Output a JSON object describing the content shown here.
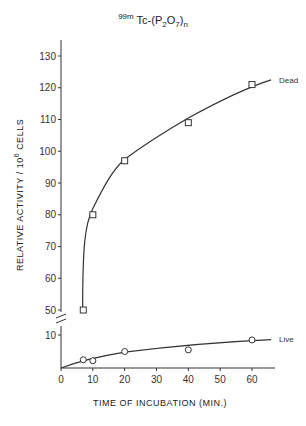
{
  "chart_data": {
    "type": "line",
    "title_parts": {
      "isotope": "99m",
      "element": "Tc-(P",
      "sub1": "2",
      "mid": "O",
      "sub2": "7",
      "close": ")",
      "sub3": "n"
    },
    "xlabel": "TIME OF INCUBATION (MIN.)",
    "ylabel": "RELATIVE ACTIVITY / 10^6 CELLS",
    "ylabel_parts": {
      "pre": "RELATIVE  ACTIVITY / 10",
      "sup": "6",
      "post": " CELLS"
    },
    "x_ticks": [
      0,
      10,
      20,
      30,
      40,
      50,
      60
    ],
    "y_ticks_upper": [
      50,
      60,
      70,
      80,
      90,
      100,
      110,
      120,
      130
    ],
    "y_ticks_lower": [
      10
    ],
    "axis_break": true,
    "xlim": [
      0,
      68
    ],
    "ylim": [
      0,
      135
    ],
    "grid": false,
    "series": [
      {
        "name": "Dead",
        "marker": "square",
        "x": [
          7,
          10,
          20,
          40,
          60
        ],
        "y": [
          50,
          80,
          97,
          109,
          121
        ]
      },
      {
        "name": "Live",
        "marker": "circle",
        "x": [
          7,
          10,
          20,
          40,
          60
        ],
        "y": [
          2.5,
          2.2,
          5,
          5.5,
          8.5
        ]
      }
    ],
    "legend": {
      "position": "inline-end-of-lines",
      "entries": [
        "Dead",
        "Live"
      ]
    }
  }
}
